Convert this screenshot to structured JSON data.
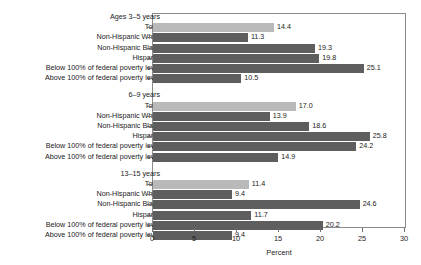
{
  "chart_data": {
    "type": "bar",
    "orientation": "horizontal",
    "title": "",
    "xlabel": "Percent",
    "ylabel": "",
    "xlim": [
      0,
      30
    ],
    "xticks": [
      0,
      5,
      10,
      15,
      20,
      25,
      30
    ],
    "xtick_labels": [
      "0",
      "5",
      "10",
      "15",
      "20",
      "25",
      "30"
    ],
    "grid": false,
    "legend": "none",
    "colors": {
      "total_bar": "#b9b9b9",
      "subgroup_bar": "#5e5e5e",
      "axis": "#6f6f6f",
      "text": "#1a1a1a",
      "background": "#ffffff"
    },
    "categories": [
      "Total",
      "Non-Hispanic White",
      "Non-Hispanic Black",
      "Hispanic",
      "Below 100% of federal poverty level",
      "Above 100% of federal poverty level"
    ],
    "groups": [
      {
        "header": "Ages 3–5 years",
        "bars": [
          {
            "label": "Total",
            "value": 14.4,
            "display": "14.4",
            "style": "total"
          },
          {
            "label": "Non-Hispanic White",
            "value": 11.3,
            "display": "11.3",
            "style": "sub"
          },
          {
            "label": "Non-Hispanic Black",
            "value": 19.3,
            "display": "19.3",
            "style": "sub"
          },
          {
            "label": "Hispanic",
            "value": 19.8,
            "display": "19.8",
            "style": "sub"
          },
          {
            "label": "Below 100% of federal poverty level",
            "value": 25.1,
            "display": "25.1",
            "style": "sub"
          },
          {
            "label": "Above 100% of federal poverty level",
            "value": 10.5,
            "display": "10.5",
            "style": "sub"
          }
        ]
      },
      {
        "header": "6–9 years",
        "bars": [
          {
            "label": "Total",
            "value": 17.0,
            "display": "17.0",
            "style": "total"
          },
          {
            "label": "Non-Hispanic White",
            "value": 13.9,
            "display": "13.9",
            "style": "sub"
          },
          {
            "label": "Non-Hispanic Black",
            "value": 18.6,
            "display": "18.6",
            "style": "sub"
          },
          {
            "label": "Hispanic",
            "value": 25.8,
            "display": "25.8",
            "style": "sub"
          },
          {
            "label": "Below 100% of federal poverty level",
            "value": 24.2,
            "display": "24.2",
            "style": "sub"
          },
          {
            "label": "Above 100% of federal poverty level",
            "value": 14.9,
            "display": "14.9",
            "style": "sub"
          }
        ]
      },
      {
        "header": "13–15 years",
        "bars": [
          {
            "label": "Total",
            "value": 11.4,
            "display": "11.4",
            "style": "total"
          },
          {
            "label": "Non-Hispanic White",
            "value": 9.4,
            "display": "9.4",
            "style": "sub"
          },
          {
            "label": "Non-Hispanic Black",
            "value": 24.6,
            "display": "24.6",
            "style": "sub"
          },
          {
            "label": "Hispanic",
            "value": 11.7,
            "display": "11.7",
            "style": "sub"
          },
          {
            "label": "Below 100% of federal poverty level",
            "value": 20.2,
            "display": "20.2",
            "style": "sub"
          },
          {
            "label": "Above 100% of federal poverty level",
            "value": 9.4,
            "display": "9.4",
            "style": "sub"
          }
        ]
      }
    ]
  }
}
